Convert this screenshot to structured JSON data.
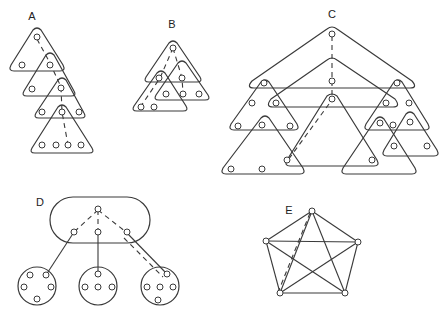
{
  "panels": {
    "A": {
      "label": "A"
    },
    "B": {
      "label": "B"
    },
    "C": {
      "label": "C"
    },
    "D": {
      "label": "D"
    },
    "E": {
      "label": "E"
    }
  },
  "colors": {
    "stroke": "#3a3a3a",
    "background": "#ffffff"
  }
}
